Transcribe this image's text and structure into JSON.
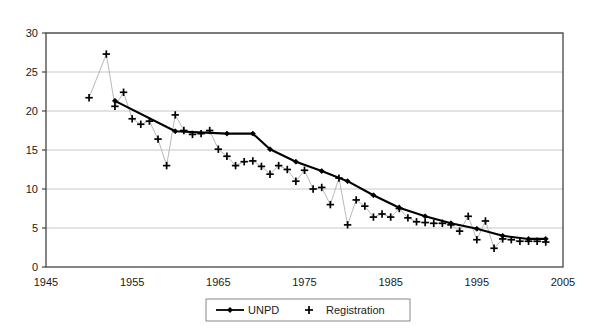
{
  "chart_data": {
    "type": "line",
    "title": "",
    "subtitle": "",
    "xlabel": "",
    "ylabel": "",
    "xlim": [
      1945,
      2005
    ],
    "ylim": [
      0,
      30
    ],
    "xticks": [
      1945,
      1955,
      1965,
      1975,
      1985,
      1995,
      2005
    ],
    "yticks": [
      0,
      5,
      10,
      15,
      20,
      25,
      30
    ],
    "grid": "horizontal",
    "legend_position": "bottom-center",
    "series": [
      {
        "name": "UNPD",
        "marker": "diamond",
        "style": "line-with-markers",
        "color": "#000000",
        "x": [
          1953,
          1960,
          1966,
          1969,
          1971,
          1974,
          1977,
          1980,
          1983,
          1986,
          1989,
          1992,
          1995,
          1998,
          2001,
          2003
        ],
        "values": [
          21.3,
          17.4,
          17.1,
          17.1,
          15.1,
          13.5,
          12.3,
          11.0,
          9.2,
          7.6,
          6.5,
          5.6,
          4.9,
          4.0,
          3.6,
          3.6
        ]
      },
      {
        "name": "Registration",
        "marker": "plus",
        "style": "thin-line-with-markers",
        "color": "#000000",
        "x": [
          1950,
          1952,
          1953,
          1954,
          1955,
          1956,
          1957,
          1958,
          1959,
          1960,
          1961,
          1962,
          1963,
          1964,
          1965,
          1966,
          1967,
          1968,
          1969,
          1970,
          1971,
          1972,
          1973,
          1974,
          1975,
          1976,
          1977,
          1978,
          1979,
          1980,
          1981,
          1982,
          1983,
          1984,
          1985,
          1986,
          1987,
          1988,
          1989,
          1990,
          1991,
          1992,
          1993,
          1994,
          1995,
          1996,
          1997,
          1998,
          1999,
          2000,
          2001,
          2002,
          2003
        ],
        "values": [
          21.7,
          27.3,
          20.6,
          22.4,
          19.0,
          18.3,
          18.7,
          16.4,
          13.0,
          19.5,
          17.5,
          17.0,
          17.1,
          17.5,
          15.1,
          14.2,
          13.0,
          13.5,
          13.6,
          12.9,
          11.9,
          13.0,
          12.5,
          11.0,
          12.4,
          10.0,
          10.2,
          8.0,
          11.4,
          5.4,
          8.6,
          7.8,
          6.4,
          6.8,
          6.4,
          7.5,
          6.3,
          5.8,
          5.7,
          5.6,
          5.6,
          5.4,
          4.6,
          6.5,
          3.5,
          5.9,
          2.4,
          3.6,
          3.5,
          3.3,
          3.3,
          3.3,
          3.2
        ]
      }
    ],
    "legend": [
      {
        "label": "UNPD",
        "marker": "line-diamond"
      },
      {
        "label": "Registration",
        "marker": "plus"
      }
    ]
  },
  "colors": {
    "axis": "#444444",
    "grid": "#c8c8c8",
    "series_unpd": "#000000",
    "series_registration": "#000000",
    "legend_border": "#888888",
    "background": "#ffffff"
  }
}
